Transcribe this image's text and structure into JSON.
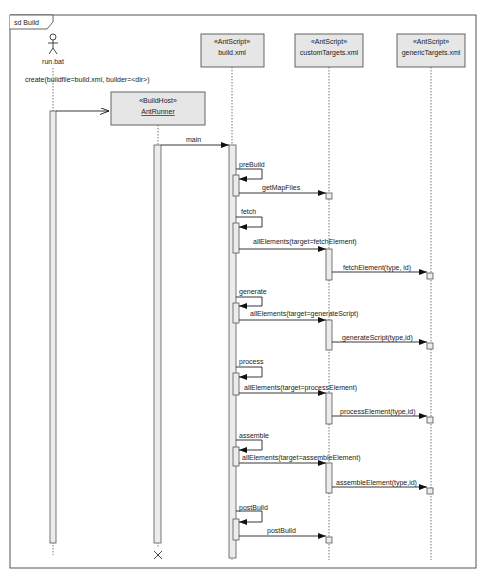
{
  "frame": {
    "title": "sd Build"
  },
  "actor": {
    "name": "run.bat"
  },
  "lifelines": [
    {
      "id": "antrunner",
      "stereotype": "«BuildHost»",
      "name": "AntRunner"
    },
    {
      "id": "build",
      "stereotype": "«AntScript»",
      "name": "build.xml"
    },
    {
      "id": "custom",
      "stereotype": "«AntScript»",
      "name": "customTargets.xml"
    },
    {
      "id": "generic",
      "stereotype": "«AntScript»",
      "name": "genericTargets.xml"
    }
  ],
  "messages": {
    "create": "create(buildfile=build.xml, builder=<dir>)",
    "main": "main",
    "preBuild": "preBuild",
    "getMapFiles": "getMapFiles",
    "fetch": "fetch",
    "allFetch": "allElements(target=fetchElement)",
    "fetchElement": "fetchElement(type, id)",
    "generate": "generate",
    "allGenerate": "allElements(target=generateScript)",
    "generateScript": "generateScript(type,id)",
    "process": "process",
    "allProcess": "allElements(target=processElement)",
    "processElement": "processElement(type,id)",
    "assemble": "assemble",
    "allAssemble": "allElements(target=assembleElement)",
    "assembleElement": "assembleElement(type,id)",
    "postBuild": "postBuild",
    "postBuildCall": "postBuild"
  },
  "colors": {
    "box": "#e6e6e6",
    "line": "#444444",
    "activation": "#e8e8e8"
  }
}
